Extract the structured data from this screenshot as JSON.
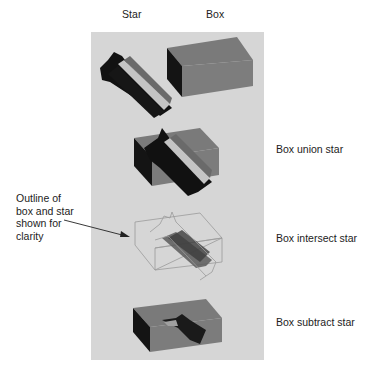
{
  "columns": {
    "star": "Star",
    "box": "Box"
  },
  "rows": [
    {
      "label": "Box union star"
    },
    {
      "label": "Box intersect star"
    },
    {
      "label": "Box subtract star"
    }
  ],
  "annotation": {
    "lines": [
      "Outline of",
      "box and star",
      "shown for",
      "clarity"
    ]
  },
  "colors": {
    "panel": "#d6d6d6",
    "box_face": "#7b7b7b",
    "box_side": "#1a1a1a",
    "star_dark": "#111111",
    "star_mid": "#6e6e6e",
    "star_light": "#bdbdbd",
    "outline": "#9a9a9a"
  }
}
